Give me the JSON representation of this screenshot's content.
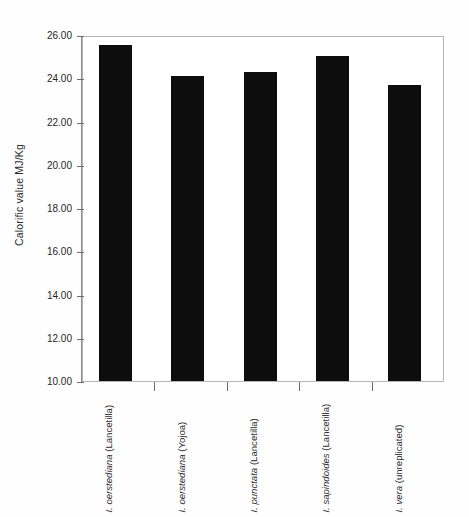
{
  "chart_data": {
    "type": "bar",
    "title": "",
    "xlabel": "",
    "ylabel": "Calorific value MJ/Kg",
    "ylim": [
      10.0,
      26.0
    ],
    "ytick_labels": [
      "26.00",
      "24.00",
      "22.00",
      "20.00",
      "18.00",
      "16.00",
      "14.00",
      "12.00",
      "10.00"
    ],
    "ytick_values": [
      26.0,
      24.0,
      22.0,
      20.0,
      18.0,
      16.0,
      14.0,
      12.0,
      10.0
    ],
    "grid": false,
    "legend": null,
    "bar_color": "#0d0d0d",
    "frame_color": "#b4b4b4",
    "categories": [
      "I. oerstediana (Lancetilla)",
      "I. oerstediana (Yojoa)",
      "I. punctata (Lancetilla)",
      "I. sapindoides (Lancetilla)",
      "I. vera (unreplicated)"
    ],
    "category_species": [
      "I. oerstediana",
      "I. oerstediana",
      "I. punctata",
      "I. sapindoides",
      "I. vera"
    ],
    "category_site": [
      "(Lancetilla)",
      "(Yojoa)",
      "(Lancetilla)",
      "(Lancetilla)",
      "(unreplicated)"
    ],
    "values": [
      25.55,
      24.1,
      24.3,
      25.05,
      23.7
    ]
  }
}
